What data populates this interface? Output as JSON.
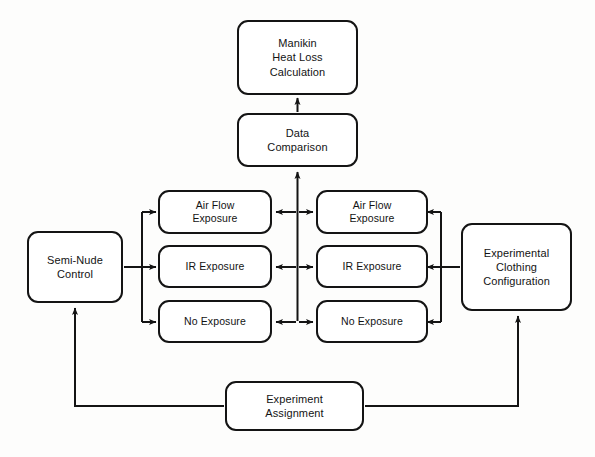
{
  "diagram": {
    "type": "flowchart",
    "background_color": "#fdfdfc",
    "line_color": "#141414",
    "text_color": "#131313",
    "nodes": [
      {
        "id": "manikin-heat-loss-calculation",
        "label": "Manikin\nHeat Loss\nCalculation",
        "x": 237,
        "y": 20,
        "w": 121,
        "h": 75
      },
      {
        "id": "data-comparison",
        "label": "Data\nComparison",
        "x": 237,
        "y": 113,
        "w": 121,
        "h": 54
      },
      {
        "id": "left-air-flow-exposure",
        "label": "Air Flow\nExposure",
        "x": 158,
        "y": 190,
        "w": 114,
        "h": 44
      },
      {
        "id": "left-ir-exposure",
        "label": "IR Exposure",
        "x": 158,
        "y": 245,
        "w": 114,
        "h": 43
      },
      {
        "id": "left-no-exposure",
        "label": "No Exposure",
        "x": 158,
        "y": 300,
        "w": 114,
        "h": 43
      },
      {
        "id": "right-air-flow-exposure",
        "label": "Air Flow\nExposure",
        "x": 316,
        "y": 190,
        "w": 112,
        "h": 44
      },
      {
        "id": "right-ir-exposure",
        "label": "IR Exposure",
        "x": 316,
        "y": 245,
        "w": 112,
        "h": 43
      },
      {
        "id": "right-no-exposure",
        "label": "No Exposure",
        "x": 316,
        "y": 300,
        "w": 112,
        "h": 43
      },
      {
        "id": "semi-nude-control",
        "label": "Semi-Nude\nControl",
        "x": 27,
        "y": 231,
        "w": 96,
        "h": 72
      },
      {
        "id": "experimental-clothing-configuration",
        "label": "Experimental\nClothing\nConfiguration",
        "x": 461,
        "y": 223,
        "w": 111,
        "h": 88
      },
      {
        "id": "experiment-assignment",
        "label": "Experiment\nAssignment",
        "x": 225,
        "y": 381,
        "w": 139,
        "h": 50
      }
    ],
    "edges": [
      {
        "id": "data-comparison-to-manikin",
        "from": "data-comparison",
        "to": "manikin-heat-loss-calculation",
        "arrow": "single"
      },
      {
        "id": "comparison-bus-to-data-comparison",
        "from": "comparison-bus",
        "to": "data-comparison",
        "arrow": "single"
      },
      {
        "id": "semi-nude-to-left-air-flow",
        "from": "semi-nude-control",
        "to": "left-air-flow-exposure",
        "arrow": "single"
      },
      {
        "id": "semi-nude-to-left-ir",
        "from": "semi-nude-control",
        "to": "left-ir-exposure",
        "arrow": "single"
      },
      {
        "id": "semi-nude-to-left-no-exposure",
        "from": "semi-nude-control",
        "to": "left-no-exposure",
        "arrow": "single"
      },
      {
        "id": "clothing-to-right-air-flow",
        "from": "experimental-clothing-configuration",
        "to": "right-air-flow-exposure",
        "arrow": "single"
      },
      {
        "id": "clothing-to-right-ir",
        "from": "experimental-clothing-configuration",
        "to": "right-ir-exposure",
        "arrow": "single"
      },
      {
        "id": "clothing-to-right-no-exposure",
        "from": "experimental-clothing-configuration",
        "to": "right-no-exposure",
        "arrow": "single"
      },
      {
        "id": "air-flow-comparison",
        "from": "left-air-flow-exposure",
        "to": "right-air-flow-exposure",
        "arrow": "double"
      },
      {
        "id": "ir-comparison",
        "from": "left-ir-exposure",
        "to": "right-ir-exposure",
        "arrow": "double"
      },
      {
        "id": "no-exposure-comparison",
        "from": "left-no-exposure",
        "to": "right-no-exposure",
        "arrow": "double"
      },
      {
        "id": "assignment-to-semi-nude",
        "from": "experiment-assignment",
        "to": "semi-nude-control",
        "arrow": "single"
      },
      {
        "id": "assignment-to-clothing",
        "from": "experiment-assignment",
        "to": "experimental-clothing-configuration",
        "arrow": "single"
      }
    ]
  }
}
